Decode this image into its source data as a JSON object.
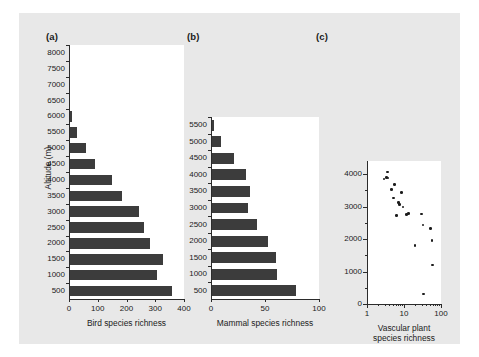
{
  "figure": {
    "background": "#e8e8e8",
    "bar_color": "#3c3c3c",
    "point_color": "#1c1c1c",
    "shared_y_axis_title": "Altitude (m)",
    "panel_labels": {
      "a": "(a)",
      "b": "(b)",
      "c": "(c)"
    }
  },
  "chart_data": [
    {
      "type": "bar",
      "panel": "(a)",
      "orientation": "horizontal",
      "title": "",
      "xlabel": "Bird species richness",
      "ylabel": "Altitude (m)",
      "xlim": [
        0,
        400
      ],
      "xticks": [
        0,
        100,
        200,
        300,
        400
      ],
      "xticklabels": [
        "0",
        "100",
        "200",
        "300",
        "400"
      ],
      "ylim": [
        250,
        8250
      ],
      "grid": false,
      "categories": [
        8000,
        7500,
        7000,
        6500,
        6000,
        5500,
        5000,
        4500,
        4000,
        3500,
        3000,
        2500,
        2000,
        1500,
        1000,
        500
      ],
      "categories_labels": [
        "8000",
        "7500",
        "7000",
        "6500",
        "6000",
        "5500",
        "5000",
        "4500",
        "4000",
        "3500",
        "3000",
        "2500",
        "2000",
        "1500",
        "1000",
        "500"
      ],
      "values": [
        0,
        0,
        0,
        0,
        12,
        28,
        60,
        92,
        148,
        185,
        243,
        262,
        282,
        326,
        307,
        357
      ]
    },
    {
      "type": "bar",
      "panel": "(b)",
      "orientation": "horizontal",
      "title": "",
      "xlabel": "Mammal species richness",
      "ylabel": "Altitude (m)",
      "xlim": [
        0,
        100
      ],
      "xticks": [
        0,
        50,
        100
      ],
      "xticklabels": [
        "0",
        "50",
        "100"
      ],
      "ylim": [
        250,
        5750
      ],
      "grid": false,
      "categories": [
        5500,
        5000,
        4500,
        4000,
        3500,
        3000,
        2500,
        2000,
        1500,
        1000,
        500
      ],
      "categories_labels": [
        "5500",
        "5000",
        "4500",
        "4000",
        "3500",
        "3000",
        "2500",
        "2000",
        "1500",
        "1000",
        "500"
      ],
      "values": [
        3,
        9,
        21,
        32,
        36,
        34,
        43,
        53,
        60,
        61,
        79
      ]
    },
    {
      "type": "scatter",
      "panel": "(c)",
      "title": "",
      "xlabel": "Vascular plant species richness",
      "ylabel": "Altitude (m)",
      "xscale": "log",
      "xlim": [
        1,
        100
      ],
      "xticks": [
        1,
        10,
        100
      ],
      "xticklabels": [
        "1",
        "10",
        "100"
      ],
      "ylim": [
        0,
        4400
      ],
      "yticks": [
        0,
        1000,
        2000,
        3000,
        4000
      ],
      "yticklabels": [
        "0",
        "1000",
        "2000",
        "3000",
        "4000"
      ],
      "grid": false,
      "points": [
        {
          "x": 2.9,
          "y": 3850
        },
        {
          "x": 3.4,
          "y": 3900
        },
        {
          "x": 3.6,
          "y": 4060
        },
        {
          "x": 3.7,
          "y": 3880
        },
        {
          "x": 4.6,
          "y": 3520
        },
        {
          "x": 5.3,
          "y": 3260
        },
        {
          "x": 5.6,
          "y": 3680
        },
        {
          "x": 6.2,
          "y": 2720
        },
        {
          "x": 7.1,
          "y": 3130
        },
        {
          "x": 7.6,
          "y": 3060
        },
        {
          "x": 8.6,
          "y": 3430
        },
        {
          "x": 9.4,
          "y": 2990
        },
        {
          "x": 11.5,
          "y": 2760
        },
        {
          "x": 13.0,
          "y": 2780
        },
        {
          "x": 20.0,
          "y": 1800
        },
        {
          "x": 30.0,
          "y": 2770
        },
        {
          "x": 33.0,
          "y": 2430
        },
        {
          "x": 34.0,
          "y": 310
        },
        {
          "x": 52.0,
          "y": 2330
        },
        {
          "x": 57.0,
          "y": 1960
        },
        {
          "x": 60.0,
          "y": 1200
        }
      ]
    }
  ]
}
